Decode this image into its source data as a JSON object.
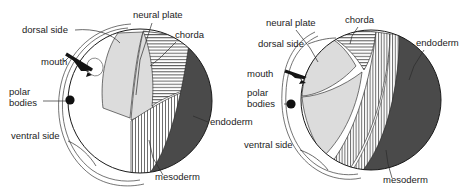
{
  "figure": {
    "background_color": "#ffffff",
    "width": 474,
    "height": 195
  },
  "palette": {
    "ectoderm_white": "#ffffff",
    "neural_plate_gray": "#dcdcdc",
    "endoderm_dark_gray": "#4a4a4a",
    "chorda_hatch": "#6b6b6b",
    "mesoderm_hatch": "#7a7a7a",
    "outline": "#1a1a1a",
    "text": "#1c1c1c"
  },
  "panels": [
    {
      "id": "left",
      "name": "left-embryo-diagram",
      "labels": [
        {
          "key": "dorsal_side",
          "text": "dorsal side",
          "x": 22,
          "y": 33
        },
        {
          "key": "neural_plate",
          "text": "neural plate",
          "x": 133,
          "y": 18
        },
        {
          "key": "chorda",
          "text": "chorda",
          "x": 175,
          "y": 38
        },
        {
          "key": "mouth",
          "text": "mouth",
          "x": 41,
          "y": 65
        },
        {
          "key": "polar_bodies_line1",
          "text": "polar",
          "x": 9,
          "y": 95
        },
        {
          "key": "polar_bodies_line2",
          "text": "bodies",
          "x": 9,
          "y": 106
        },
        {
          "key": "ventral_side",
          "text": "ventral side",
          "x": 11,
          "y": 139
        },
        {
          "key": "endoderm",
          "text": "endoderm",
          "x": 210,
          "y": 125
        },
        {
          "key": "mesoderm",
          "text": "mesoderm",
          "x": 155,
          "y": 180
        }
      ],
      "regions": [
        {
          "key": "ectoderm",
          "fill": "white"
        },
        {
          "key": "neural_plate",
          "fill": "light-gray"
        },
        {
          "key": "chorda",
          "fill": "horizontal-hatch"
        },
        {
          "key": "mesoderm",
          "fill": "vertical-hatch"
        },
        {
          "key": "endoderm",
          "fill": "dark-gray"
        }
      ]
    },
    {
      "id": "right",
      "name": "right-embryo-diagram",
      "labels": [
        {
          "key": "neural_plate",
          "text": "neural plate",
          "x": 266,
          "y": 26
        },
        {
          "key": "chorda",
          "text": "chorda",
          "x": 345,
          "y": 23
        },
        {
          "key": "dorsal_side",
          "text": "dorsal side",
          "x": 258,
          "y": 47
        },
        {
          "key": "endoderm",
          "text": "endoderm",
          "x": 416,
          "y": 46
        },
        {
          "key": "mouth",
          "text": "mouth",
          "x": 247,
          "y": 77
        },
        {
          "key": "polar_bodies_line1",
          "text": "polar",
          "x": 247,
          "y": 96
        },
        {
          "key": "polar_bodies_line2",
          "text": "bodies",
          "x": 247,
          "y": 107
        },
        {
          "key": "ventral_side",
          "text": "ventral side",
          "x": 244,
          "y": 148
        },
        {
          "key": "mesoderm",
          "text": "mesoderm",
          "x": 383,
          "y": 183
        }
      ],
      "regions": [
        {
          "key": "ectoderm",
          "fill": "white"
        },
        {
          "key": "neural_plate",
          "fill": "light-gray"
        },
        {
          "key": "chorda",
          "fill": "horizontal-hatch"
        },
        {
          "key": "mesoderm",
          "fill": "vertical-hatch"
        },
        {
          "key": "endoderm",
          "fill": "dark-gray"
        }
      ]
    }
  ]
}
